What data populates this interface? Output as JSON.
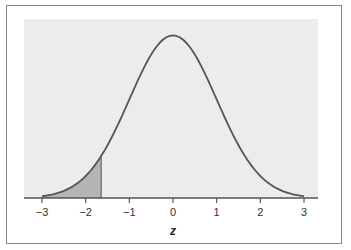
{
  "chart_data": {
    "type": "area",
    "title": "",
    "subtitle": "Standard normal distribution with shaded left tail",
    "xlabel": "z",
    "ylabel": "",
    "xlim": [
      -3,
      3
    ],
    "ylim": [
      0,
      0.4
    ],
    "grid": false,
    "legend": null,
    "x_ticks": [
      -3,
      -2,
      -1,
      0,
      1,
      2,
      3
    ],
    "x_tick_labels": [
      "−3",
      "−2",
      "−1",
      "0",
      "1",
      "2",
      "3"
    ],
    "series": [
      {
        "name": "standard normal density",
        "function": "N(0,1) pdf",
        "x": [
          -3,
          -2.5,
          -2,
          -1.645,
          -1.5,
          -1,
          -0.5,
          0,
          0.5,
          1,
          1.5,
          2,
          2.5,
          3
        ],
        "values": [
          0.0044,
          0.0175,
          0.054,
          0.1031,
          0.1295,
          0.242,
          0.3521,
          0.3989,
          0.3521,
          0.242,
          0.1295,
          0.054,
          0.0175,
          0.0044
        ],
        "color": "#555555"
      }
    ],
    "shaded_region": {
      "from": -3,
      "to": -1.645,
      "color": "#b5b5b5",
      "boundary_line_x": -1.645
    },
    "colors": {
      "plot_background": "#ececec",
      "curve": "#555555",
      "shade": "#b5b5b5",
      "frame": "#8a8a8a",
      "axis": "#555555"
    }
  }
}
